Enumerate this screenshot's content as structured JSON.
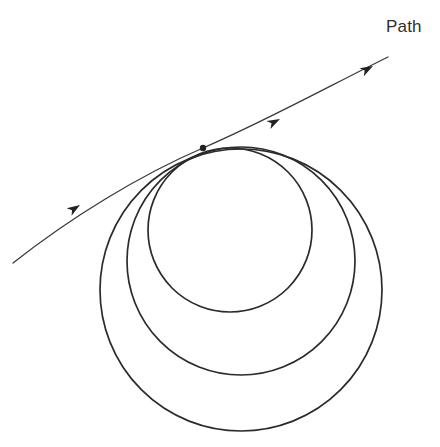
{
  "figure": {
    "type": "geometric-diagram",
    "width": 440,
    "height": 447,
    "background_color": "#ffffff"
  },
  "labels": {
    "path": "Path"
  },
  "colors": {
    "path_stroke": "#3a3a3a",
    "circle_stroke": "#2b2b2b",
    "marker_fill": "#222222",
    "label_text": "#2f2f2f",
    "background": "#ffffff"
  },
  "geometry": {
    "tangent_point": {
      "x": 203,
      "y": 148
    },
    "path": {
      "name": "Path",
      "start": {
        "x": 13,
        "y": 263
      },
      "end": {
        "x": 388,
        "y": 57
      },
      "d": "M 13,263 C 70,218 140,175 203,148 C 266,121 335,83 388,57",
      "stroke_width": 1.3,
      "arrow_count": 3
    },
    "arrows": [
      {
        "name": "arrow-lower-left",
        "x": 80,
        "y": 205,
        "angle": -33
      },
      {
        "name": "arrow-middle",
        "x": 280,
        "y": 119,
        "angle": -27
      },
      {
        "name": "arrow-upper-right",
        "x": 373,
        "y": 66,
        "angle": -29
      }
    ],
    "circles": [
      {
        "name": "small-circle",
        "cx": 230,
        "cy": 230,
        "r": 82,
        "left": 148,
        "right": 312,
        "top": 148,
        "bottom": 312,
        "stroke_width": 1.7
      },
      {
        "name": "medium-circle",
        "cx": 241,
        "cy": 261,
        "r": 114,
        "left": 127,
        "right": 355,
        "top": 147,
        "bottom": 375,
        "stroke_width": 1.7
      },
      {
        "name": "large-circle",
        "cx": 241,
        "cy": 290,
        "r": 141,
        "left": 100,
        "right": 382,
        "top": 149,
        "bottom": 431,
        "stroke_width": 1.7
      }
    ],
    "marker": {
      "name": "tangent-point-dot",
      "cx": 203,
      "cy": 148,
      "r": 3.2
    }
  }
}
